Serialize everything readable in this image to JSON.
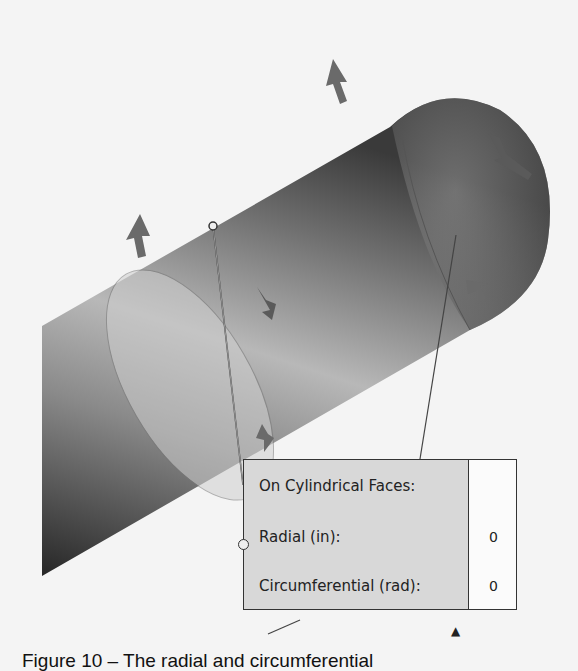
{
  "figure": {
    "caption": "Figure 10 – The radial and circumferential"
  },
  "popup": {
    "heading": "On Cylindrical Faces:",
    "rows": [
      {
        "label": "Radial (in):",
        "value": "0"
      },
      {
        "label": "Circumferential (rad):",
        "value": "0"
      }
    ]
  },
  "colors": {
    "popup_bg": "#d8d8d8",
    "value_bg": "#fbfbfb",
    "border": "#333333"
  }
}
